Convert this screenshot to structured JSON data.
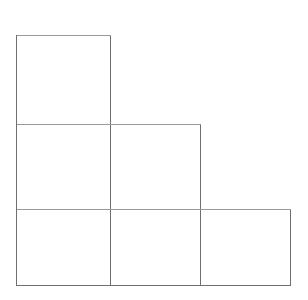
{
  "figure": {
    "name": "staircase-square-grid",
    "background_color": "#ffffff",
    "canvas": {
      "width": 308,
      "height": 300
    },
    "stroke": {
      "color": "#6e6e6e",
      "light_color": "#9a9a9a",
      "width": 1
    },
    "geometry": {
      "column_edges": [
        16,
        110,
        200,
        290
      ],
      "row_edges": [
        35,
        124,
        209,
        285
      ],
      "cell_width": 94,
      "cell_heights": [
        89,
        85,
        76
      ]
    },
    "rows": [
      {
        "label": "row-1",
        "cell_count": 1,
        "cells": [
          {
            "label": "cell-r1c1",
            "x": 16,
            "y": 35,
            "width": 94,
            "height": 89
          }
        ]
      },
      {
        "label": "row-2",
        "cell_count": 2,
        "cells": [
          {
            "label": "cell-r2c1",
            "x": 16,
            "y": 124,
            "width": 94,
            "height": 85
          },
          {
            "label": "cell-r2c2",
            "x": 110,
            "y": 124,
            "width": 90,
            "height": 85
          }
        ]
      },
      {
        "label": "row-3",
        "cell_count": 3,
        "cells": [
          {
            "label": "cell-r3c1",
            "x": 16,
            "y": 209,
            "width": 94,
            "height": 76
          },
          {
            "label": "cell-r3c2",
            "x": 110,
            "y": 209,
            "width": 90,
            "height": 76
          },
          {
            "label": "cell-r3c3",
            "x": 200,
            "y": 209,
            "width": 90,
            "height": 76
          }
        ]
      }
    ],
    "total_cells": 6
  }
}
